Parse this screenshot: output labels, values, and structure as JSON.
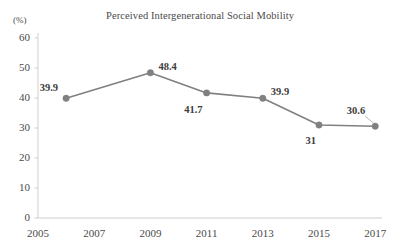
{
  "chart_data": {
    "type": "line",
    "title": "Perceived Intergenerational Social Mobility",
    "xlabel": "",
    "ylabel": "(%)",
    "x": [
      2006,
      2009,
      2011,
      2013,
      2015,
      2017
    ],
    "values": [
      39.9,
      48.4,
      41.7,
      39.9,
      31,
      30.6
    ],
    "point_labels": [
      "39.9",
      "48.4",
      "41.7",
      "39.9",
      "31",
      "30.6"
    ],
    "xlim": [
      2005,
      2017.9
    ],
    "ylim": [
      0,
      60
    ],
    "x_ticks": [
      2005,
      2007,
      2009,
      2011,
      2013,
      2015,
      2017
    ],
    "x_tick_labels": [
      "2005",
      "2007",
      "2009",
      "2011",
      "2013",
      "2015",
      "2017"
    ],
    "y_ticks": [
      0,
      10,
      20,
      30,
      40,
      50,
      60
    ],
    "y_tick_labels": [
      "0",
      "10",
      "20",
      "30",
      "40",
      "50",
      "60"
    ],
    "grid": false,
    "legend": null,
    "series_color": "#808080",
    "marker_color": "#808080",
    "axis_color": "#cfcfcf",
    "text_color": "#4a4a4a"
  },
  "axis": {
    "unit_label": "(%)"
  }
}
